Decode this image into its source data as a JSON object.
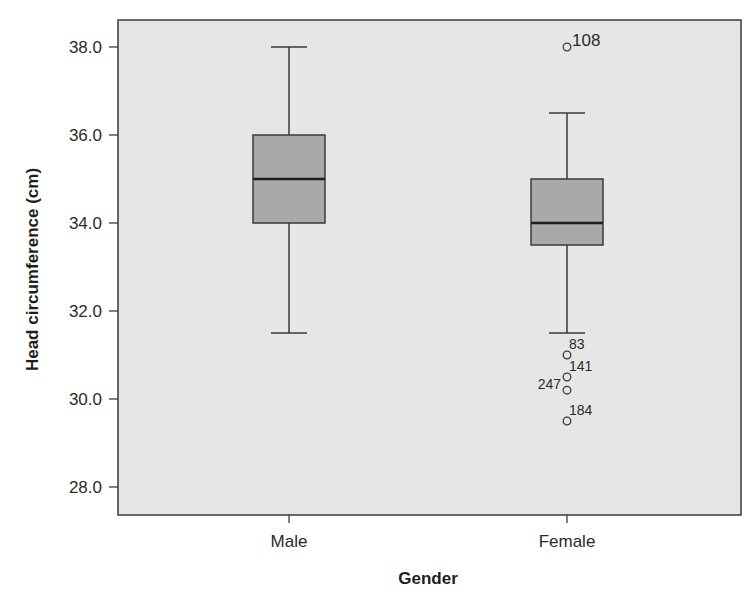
{
  "chart_data": {
    "type": "boxplot",
    "title": "",
    "xlabel": "Gender",
    "ylabel": "Head circumference (cm)",
    "ylim": [
      27.4,
      38.6
    ],
    "yticks": [
      28.0,
      30.0,
      32.0,
      34.0,
      36.0,
      38.0
    ],
    "ytick_labels": [
      "28.0",
      "30.0",
      "32.0",
      "34.0",
      "36.0",
      "38.0"
    ],
    "grid": false,
    "legend": "none",
    "categories": [
      "Male",
      "Female"
    ],
    "boxes": [
      {
        "category": "Male",
        "whisker_low": 31.5,
        "q1": 34.0,
        "median": 35.0,
        "q3": 36.0,
        "whisker_high": 38.0,
        "outliers": []
      },
      {
        "category": "Female",
        "whisker_low": 31.5,
        "q1": 33.5,
        "median": 34.0,
        "q3": 35.0,
        "whisker_high": 36.5,
        "outliers": [
          {
            "id": "108",
            "value": 38.0,
            "label_side": "right-big"
          },
          {
            "id": "83",
            "value": 31.0,
            "label_side": "right-above"
          },
          {
            "id": "141",
            "value": 30.5,
            "label_side": "right-above"
          },
          {
            "id": "247",
            "value": 30.2,
            "label_side": "left-above"
          },
          {
            "id": "184",
            "value": 29.5,
            "label_side": "right-above"
          }
        ]
      }
    ],
    "colors": {
      "plot_background": "#e6e6e6",
      "box_fill": "#a9a9a9",
      "line": "#3a3a3a",
      "median": "#1e1e1e"
    }
  }
}
